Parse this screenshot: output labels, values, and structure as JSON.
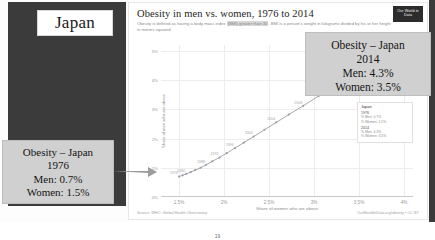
{
  "slide": {
    "country_badge": "Japan",
    "page_number": "19"
  },
  "chart": {
    "logo": "Our World in Data",
    "title": "Obesity in men vs. women, 1976 to 2014",
    "subtitle_part1": "Obesity is defined as having a body mass index ",
    "subtitle_highlight": "(BMI) greater than 30",
    "subtitle_part2": ". BMI is a person's weight in kilograms divided by his or her height in metres squared.",
    "ylabel": "Share of men who are obese",
    "xlabel": "Share of women who are obese",
    "source_left": "Source: WHO, Global Health Observatory",
    "source_right": "OurWorldInData.org/obesity • CC BY"
  },
  "tooltip": {
    "country": "Japan",
    "year_1976": "1976",
    "men_1976": "% Men: 0.7%",
    "women_1976": "% Women: 1.5%",
    "year_2014": "2014",
    "men_2014": "% Men: 4.3%",
    "women_2014": "% Women: 3.5%"
  },
  "callout_1976": {
    "line1": "Obesity – Japan",
    "line2": "1976",
    "line3": "Men: 0.7%",
    "line4": "Women: 1.5%"
  },
  "callout_2014": {
    "line1": "Obesity – Japan",
    "line2": "2014",
    "line3": "Men: 4.3%",
    "line4": "Women: 3.5%"
  },
  "chart_data": {
    "type": "scatter",
    "title": "Obesity in men vs. women, 1976 to 2014",
    "xlabel": "Share of women who are obese",
    "ylabel": "Share of men who are obese",
    "xlim": [
      1.3,
      4.1
    ],
    "ylim": [
      0,
      5.2
    ],
    "xticks": [
      "1.5%",
      "2%",
      "2.5%",
      "3%",
      "3.5%",
      "4%"
    ],
    "xtick_values": [
      1.5,
      2.0,
      2.5,
      3.0,
      3.5,
      4.0
    ],
    "yticks": [
      "0%",
      "1%",
      "2%",
      "3%",
      "4%",
      "5%"
    ],
    "ytick_values": [
      0,
      1,
      2,
      3,
      4,
      5
    ],
    "grid": true,
    "legend": "none",
    "connected_scatter": true,
    "series": [
      {
        "name": "Japan",
        "color": "#9aa0a6",
        "points": [
          {
            "year": "1976",
            "x": 1.5,
            "y": 0.7,
            "label": "1976"
          },
          {
            "year": "1978",
            "x": 1.54,
            "y": 0.74,
            "label": ""
          },
          {
            "year": "1980",
            "x": 1.58,
            "y": 0.79,
            "label": "1980"
          },
          {
            "year": "1982",
            "x": 1.63,
            "y": 0.85,
            "label": ""
          },
          {
            "year": "1984",
            "x": 1.68,
            "y": 0.92,
            "label": ""
          },
          {
            "year": "1986",
            "x": 1.74,
            "y": 1.0,
            "label": ""
          },
          {
            "year": "1988",
            "x": 1.8,
            "y": 1.1,
            "label": "1988"
          },
          {
            "year": "1990",
            "x": 1.87,
            "y": 1.22,
            "label": ""
          },
          {
            "year": "1992",
            "x": 1.95,
            "y": 1.35,
            "label": "1992"
          },
          {
            "year": "1994",
            "x": 2.03,
            "y": 1.5,
            "label": ""
          },
          {
            "year": "1996",
            "x": 2.12,
            "y": 1.67,
            "label": "1996"
          },
          {
            "year": "1998",
            "x": 2.22,
            "y": 1.86,
            "label": ""
          },
          {
            "year": "2000",
            "x": 2.33,
            "y": 2.07,
            "label": "2000"
          },
          {
            "year": "2002",
            "x": 2.45,
            "y": 2.3,
            "label": ""
          },
          {
            "year": "2004",
            "x": 2.58,
            "y": 2.55,
            "label": "2004"
          },
          {
            "year": "2006",
            "x": 2.72,
            "y": 2.82,
            "label": ""
          },
          {
            "year": "2008",
            "x": 2.88,
            "y": 3.12,
            "label": "2008"
          },
          {
            "year": "2010",
            "x": 3.05,
            "y": 3.45,
            "label": ""
          },
          {
            "year": "2012",
            "x": 3.24,
            "y": 3.82,
            "label": "2012"
          },
          {
            "year": "2014",
            "x": 3.5,
            "y": 4.3,
            "label": "2014"
          }
        ]
      }
    ]
  }
}
